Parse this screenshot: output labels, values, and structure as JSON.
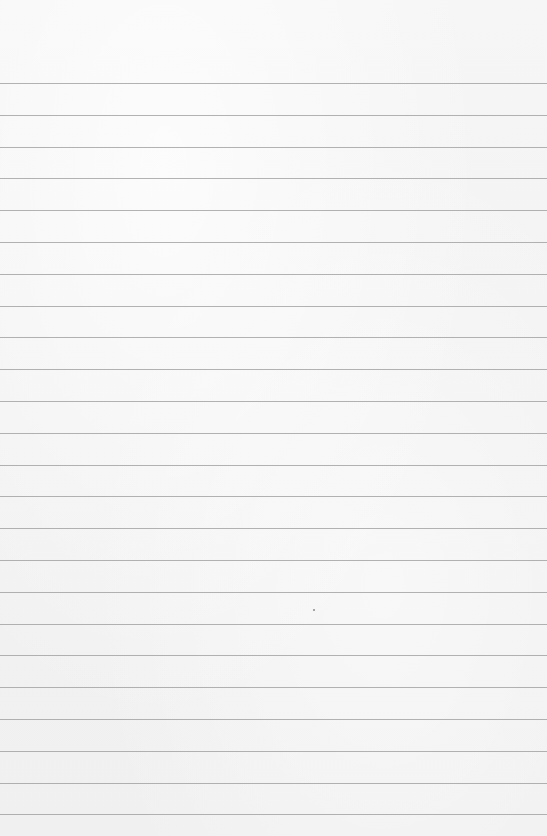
{
  "page": {
    "type": "lined-paper",
    "background_color": "#f4f4f4",
    "rule_color": "#9a9a9a",
    "rule_count": 24,
    "first_rule_y": 83,
    "rule_spacing": 31.8
  },
  "marks": [
    {
      "type": "speck",
      "x": 313,
      "y": 609
    }
  ]
}
